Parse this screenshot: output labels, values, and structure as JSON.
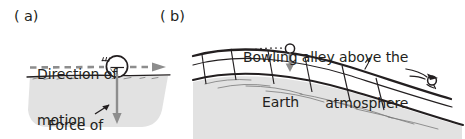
{
  "figure": {
    "caption_a": "( a)",
    "caption_b": "( b)",
    "panel_a": {
      "direction_label_line1": "Direction of",
      "direction_label_line2": "motion",
      "gravity_label_line1": "Force of",
      "gravity_label_line2": "gravity",
      "ground_fill": "#e2e2e2",
      "dashed_arrow_color": "#8d8d8d",
      "gravity_arrow_color": "#8d8d8d",
      "ink_color": "#231f20"
    },
    "panel_b": {
      "bowling_label_line1": "Bowling alley above the",
      "bowling_label_line2": "atmosphere",
      "earth_label": "Earth",
      "earth_fill": "#e2e2e2",
      "lane_fill": "#ffffff",
      "drop_arrow_color": "#8d8d8d",
      "ink_color": "#231f20"
    }
  }
}
